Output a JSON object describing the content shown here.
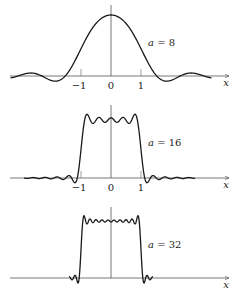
{
  "chart_data": [
    {
      "type": "line",
      "title": "",
      "annotation": "a = 8",
      "param_a": 8,
      "xlabel": "x",
      "ylabel": "",
      "x_ticks": [
        "-1",
        "0",
        "1"
      ],
      "xlim": [
        -3.4,
        3.8
      ],
      "grid": false,
      "description": "Smoothed approximation of a rectangular pulse on [-1,1] (Si-function convolution), broad single hump with side lobes"
    },
    {
      "type": "line",
      "title": "",
      "annotation": "a = 16",
      "param_a": 16,
      "xlabel": "x",
      "ylabel": "",
      "x_ticks": [
        "-1",
        "0",
        "1"
      ],
      "xlim": [
        -3.4,
        3.8
      ],
      "grid": false,
      "description": "Approximation of rectangular pulse with flat-topped ripple plateau"
    },
    {
      "type": "line",
      "title": "",
      "annotation": "a = 32",
      "param_a": 32,
      "xlabel": "x",
      "ylabel": "",
      "x_ticks": [],
      "xlim": [
        -3.4,
        3.8
      ],
      "grid": false,
      "description": "Close approximation of rectangular pulse showing Gibbs overshoot at edges"
    }
  ],
  "panels": [
    {
      "label_a": "a",
      "label_eq": "= 8",
      "tick_m1": "−1",
      "tick_0": "0",
      "tick_1": "1",
      "xlabel": "x"
    },
    {
      "label_a": "a",
      "label_eq": "= 16",
      "tick_m1": "−1",
      "tick_0": "0",
      "tick_1": "1",
      "xlabel": "x"
    },
    {
      "label_a": "a",
      "label_eq": "= 32",
      "xlabel": "x"
    }
  ]
}
